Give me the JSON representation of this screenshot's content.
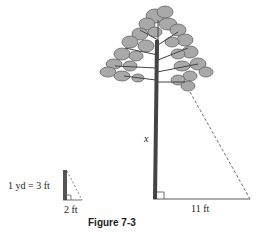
{
  "figure": {
    "caption": "Figure 7-3",
    "tree_height_label": "x",
    "tree_shadow_label": "11 ft",
    "pole_shadow_label": "2 ft",
    "conversion_label": "1 yd = 3 ft"
  },
  "colors": {
    "foliage_fill": "#a9a9a9",
    "foliage_stroke": "#555555",
    "trunk": "#444444",
    "line": "#333333",
    "text": "#222222"
  }
}
